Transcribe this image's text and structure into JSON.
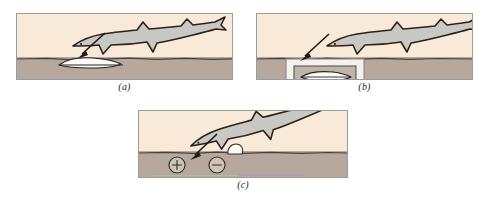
{
  "figure": {
    "colors": {
      "water": "#f9e9d8",
      "sand": "#b6a89c",
      "shark_body": "#c9c9c4",
      "outline": "#2b2218",
      "frame": "#9c9c9c",
      "flatfish": "#fbfbf7"
    },
    "panels": [
      {
        "id": "a",
        "caption": "(a)",
        "elements": {
          "shark": "shark-swimming-right",
          "prey": "flatfish-buried-in-sand",
          "arrow": "attack-arrow",
          "substrate": "sand"
        }
      },
      {
        "id": "b",
        "caption": "(b)",
        "elements": {
          "shark": "shark-swimming-right",
          "prey": "flatfish-in-agar-chamber",
          "chamber": "agar-box",
          "arrow": "attack-arrow",
          "substrate": "sand"
        }
      },
      {
        "id": "c",
        "caption": "(c)",
        "elements": {
          "shark": "shark-swimming-right",
          "electrode_positive": "+",
          "electrode_negative": "−",
          "pebble": "buried-object",
          "arrow": "attack-arrow",
          "substrate": "sand"
        }
      }
    ]
  }
}
